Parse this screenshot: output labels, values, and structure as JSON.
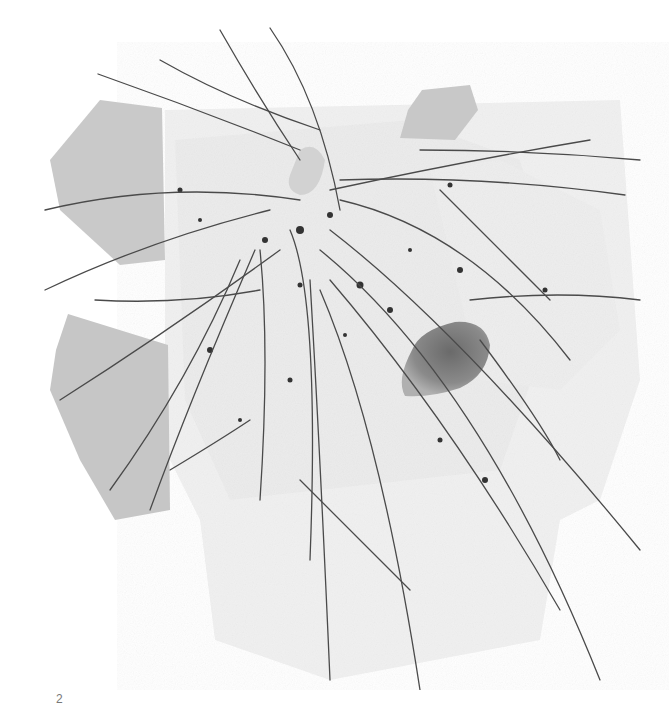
{
  "figure": {
    "colors": {
      "background": "#ffffff",
      "paper": "#f4f4f4",
      "grey_shapes": "#c8c8c8",
      "strands": "#555555",
      "stone": "#7a7a7a"
    }
  },
  "caption": {
    "page_number": "2"
  }
}
